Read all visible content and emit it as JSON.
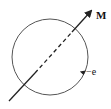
{
  "diagram": {
    "moment_label": "M",
    "charge_label": "−e",
    "colors": {
      "stroke": "#222222",
      "circle": "#555555",
      "background": "#ffffff"
    }
  }
}
